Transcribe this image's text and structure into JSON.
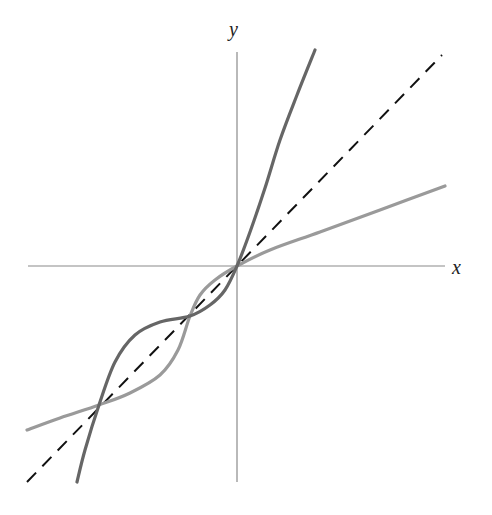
{
  "chart_data": {
    "type": "line",
    "title": "",
    "xlabel": "x",
    "ylabel": "y",
    "grid": false,
    "legend": null,
    "axis_ranges": {
      "x": [
        -3,
        3
      ],
      "y": [
        -3,
        3
      ]
    },
    "origin_px": [
      237,
      266
    ],
    "series": [
      {
        "name": "y = x (line of reflection)",
        "style": "dashed",
        "color": "#111111",
        "points_px": [
          [
            27,
            482
          ],
          [
            442,
            55
          ]
        ]
      },
      {
        "name": "f (steep curve)",
        "style": "solid",
        "color": "#666666",
        "points_px": [
          [
            77,
            482
          ],
          [
            85,
            450
          ],
          [
            99,
            405
          ],
          [
            115,
            362
          ],
          [
            135,
            335
          ],
          [
            160,
            322
          ],
          [
            190,
            316
          ],
          [
            210,
            305
          ],
          [
            225,
            290
          ],
          [
            237,
            266
          ],
          [
            250,
            232
          ],
          [
            265,
            188
          ],
          [
            280,
            140
          ],
          [
            297,
            95
          ],
          [
            315,
            50
          ]
        ]
      },
      {
        "name": "f inverse (flatter curve)",
        "style": "solid",
        "color": "#9a9a9a",
        "points_px": [
          [
            27,
            430
          ],
          [
            60,
            418
          ],
          [
            99,
            405
          ],
          [
            130,
            393
          ],
          [
            160,
            375
          ],
          [
            178,
            350
          ],
          [
            190,
            316
          ],
          [
            200,
            295
          ],
          [
            215,
            280
          ],
          [
            237,
            266
          ],
          [
            270,
            250
          ],
          [
            320,
            232
          ],
          [
            380,
            210
          ],
          [
            445,
            186
          ]
        ]
      }
    ],
    "intersections_px": [
      [
        99,
        405
      ],
      [
        190,
        316
      ],
      [
        237,
        266
      ]
    ]
  },
  "labels": {
    "x_axis": "x",
    "y_axis": "y"
  },
  "colors": {
    "axis": "#8a8a8a",
    "dashed": "#111111",
    "dark_curve": "#666666",
    "light_curve": "#9a9a9a"
  }
}
